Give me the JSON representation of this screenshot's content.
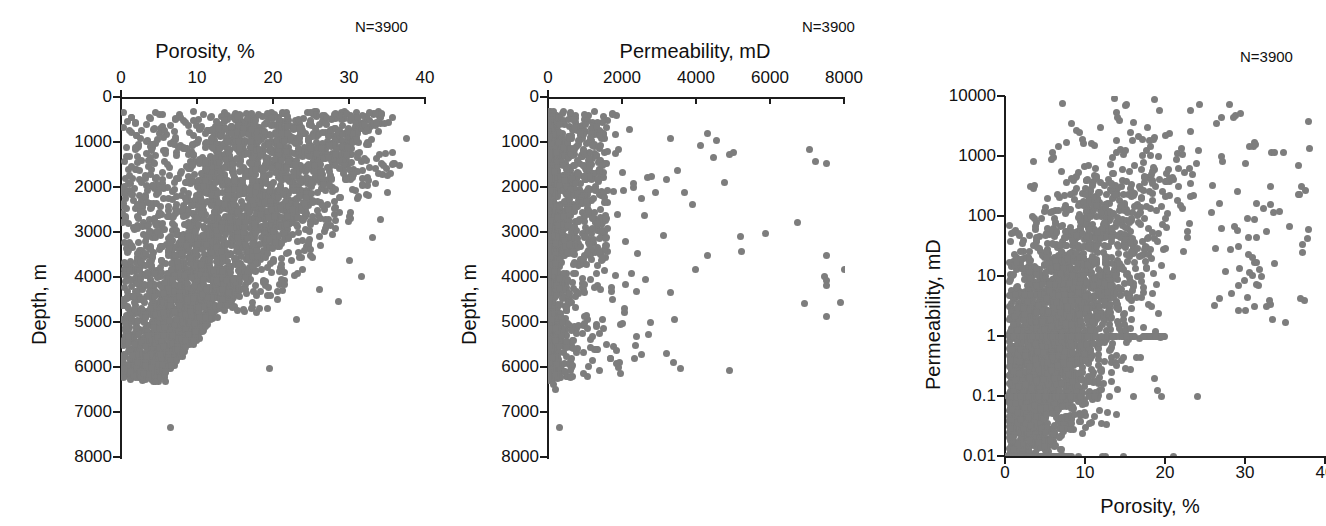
{
  "figure": {
    "background": "#ffffff",
    "marker_color": "#7d7d7d",
    "axis_color": "#1c1c1c",
    "marker_size_px": 7
  },
  "chart_data": [
    {
      "id": "porosity-depth",
      "type": "scatter",
      "title": "Porosity, %",
      "xlabel": "Porosity, %",
      "ylabel": "Depth, m",
      "annotation": "N=3900",
      "n": 3900,
      "xlim": [
        0,
        40
      ],
      "ylim": [
        0,
        8000
      ],
      "y_inverted": true,
      "xscale": "linear",
      "yscale": "linear",
      "grid": false,
      "x_ticks": [
        0,
        10,
        20,
        30,
        40
      ],
      "y_ticks": [
        0,
        1000,
        2000,
        3000,
        4000,
        5000,
        6000,
        7000,
        8000
      ],
      "x_tick_labels": [
        "0",
        "10",
        "20",
        "30",
        "40"
      ],
      "y_tick_labels": [
        "0",
        "1000",
        "2000",
        "3000",
        "4000",
        "5000",
        "6000",
        "7000",
        "8000"
      ],
      "description": "Porosity versus burial depth. Dense cloud from 0-30% porosity between 300 and 5500 m, showing a compaction trend: the maximum porosity envelope narrows from about 38% near the surface to under 10% below 5000 m. Scattered deep outliers to 6000 m and a single point near 7300 m."
    },
    {
      "id": "permeability-depth",
      "type": "scatter",
      "title": "Permeability, mD",
      "xlabel": "Permeability, mD",
      "ylabel": "Depth, m",
      "annotation": "N=3900",
      "n": 3900,
      "xlim": [
        0,
        8000
      ],
      "ylim": [
        0,
        8000
      ],
      "y_inverted": true,
      "xscale": "linear",
      "yscale": "linear",
      "grid": false,
      "x_ticks": [
        0,
        2000,
        4000,
        6000,
        8000
      ],
      "y_ticks": [
        0,
        1000,
        2000,
        3000,
        4000,
        5000,
        6000,
        7000,
        8000
      ],
      "x_tick_labels": [
        "0",
        "2000",
        "4000",
        "6000",
        "8000"
      ],
      "y_tick_labels": [
        "0",
        "1000",
        "2000",
        "3000",
        "4000",
        "5000",
        "6000",
        "7000",
        "8000"
      ],
      "description": "Permeability versus burial depth on a linear permeability axis. The overwhelming majority of samples fall below 500 mD, forming a narrow dense spike hugging the y-axis from 300 to 6200 m. A sparse tail of high-permeability outliers extends to 8000 mD, mostly shallower than 5000 m, with a few isolated clusters near 7500 mD at 3500-5000 m."
    },
    {
      "id": "permeability-porosity",
      "type": "scatter",
      "title": "",
      "xlabel": "Porosity, %",
      "ylabel": "Permeability, mD",
      "annotation": "N=3900",
      "n": 3900,
      "xlim": [
        0,
        40
      ],
      "ylim": [
        0.01,
        10000
      ],
      "y_inverted": false,
      "xscale": "linear",
      "yscale": "log",
      "grid": false,
      "x_ticks": [
        0,
        10,
        20,
        30,
        40
      ],
      "y_ticks": [
        0.01,
        0.1,
        1,
        10,
        100,
        1000,
        10000
      ],
      "x_tick_labels": [
        "0",
        "10",
        "20",
        "30",
        "40"
      ],
      "y_tick_labels": [
        "0.01",
        "0.1",
        "1",
        "10",
        "100",
        "1000",
        "10000"
      ],
      "description": "Permeability versus porosity cross-plot with a logarithmic permeability axis spanning 0.01 to 10000 mD. A broad positively-correlated cloud occupies 0-25% porosity and 0.1-5000 mD. Distinct horizontal detection-limit rows of points sit exactly on 1 mD, 0.1 mD and 0.01 mD, the 0.01 mD floor row running from 0 to about 21% porosity."
    }
  ],
  "panels": {
    "left": {
      "title": "Porosity, %",
      "n_label": "N=3900",
      "y_axis_label": "Depth, m",
      "x_tick_labels": [
        "0",
        "10",
        "20",
        "30",
        "40"
      ],
      "y_tick_labels": [
        "0",
        "1000",
        "2000",
        "3000",
        "4000",
        "5000",
        "6000",
        "7000",
        "8000"
      ]
    },
    "middle": {
      "title": "Permeability, mD",
      "n_label": "N=3900",
      "y_axis_label": "Depth, m",
      "x_tick_labels": [
        "0",
        "2000",
        "4000",
        "6000",
        "8000"
      ],
      "y_tick_labels": [
        "0",
        "1000",
        "2000",
        "3000",
        "4000",
        "5000",
        "6000",
        "7000",
        "8000"
      ]
    },
    "right": {
      "n_label": "N=3900",
      "x_axis_label": "Porosity, %",
      "y_axis_label": "Permeability, mD",
      "x_tick_labels": [
        "0",
        "10",
        "20",
        "30",
        "40"
      ],
      "y_tick_labels": [
        "10000",
        "1000",
        "100",
        "10",
        "1",
        "0.1",
        "0.01"
      ]
    }
  }
}
